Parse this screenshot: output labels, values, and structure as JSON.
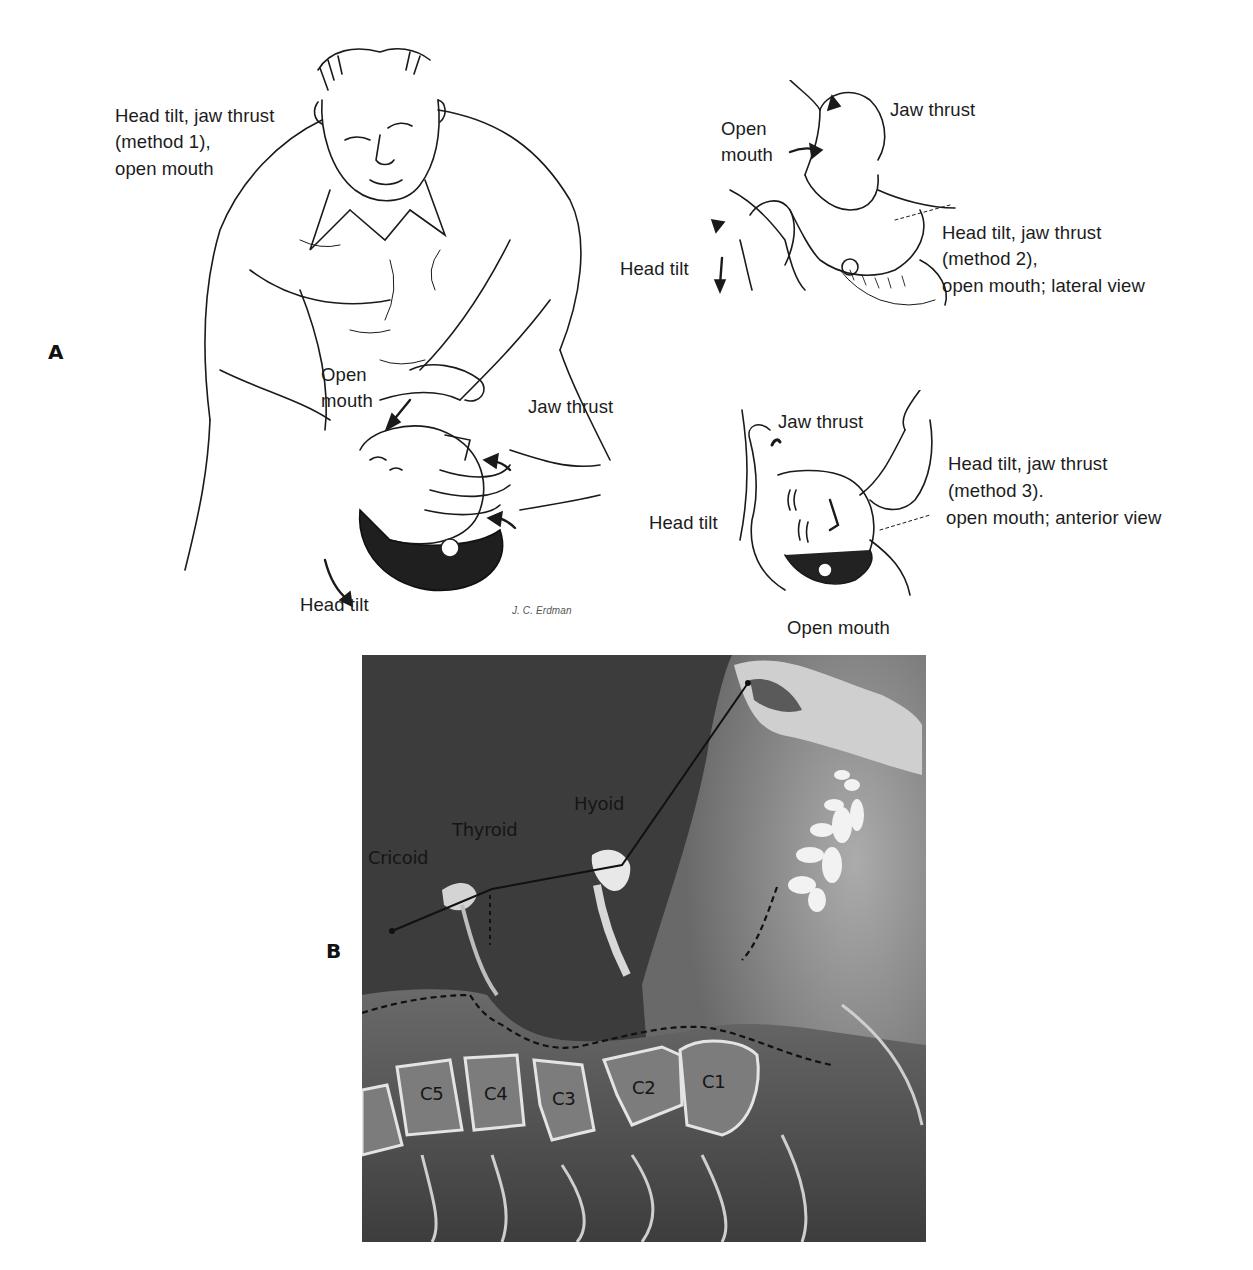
{
  "figure": {
    "panel_a": {
      "letter": "A",
      "method1": {
        "caption_lines": [
          "Head tilt, jaw thrust",
          "(method 1),",
          "open mouth"
        ],
        "labels": {
          "open_mouth": [
            "Open",
            "mouth"
          ],
          "jaw_thrust": "Jaw thrust",
          "head_tilt": "Head tilt"
        },
        "signature": "J. C. Erdman"
      },
      "method2": {
        "caption_lines": [
          "Head tilt, jaw thrust",
          "(method 2),",
          "open mouth; lateral view"
        ],
        "labels": {
          "jaw_thrust": "Jaw thrust",
          "open_mouth": [
            "Open",
            "mouth"
          ],
          "head_tilt": "Head tilt"
        }
      },
      "method3": {
        "caption_lines": [
          "Head tilt, jaw thrust",
          "(method 3).",
          "open mouth; anterior view"
        ],
        "labels": {
          "jaw_thrust": "Jaw thrust",
          "head_tilt": "Head tilt",
          "open_mouth": "Open mouth"
        }
      }
    },
    "panel_b": {
      "letter": "B",
      "structures": [
        "Cricoid",
        "Thyroid",
        "Hyoid"
      ],
      "vertebrae": [
        "C5",
        "C4",
        "C3",
        "C2",
        "C1"
      ]
    }
  }
}
